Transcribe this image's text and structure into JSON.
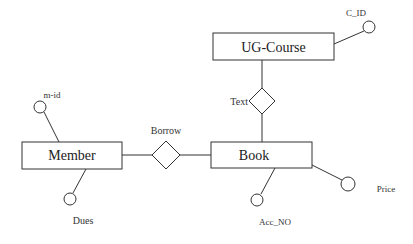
{
  "diagram": {
    "type": "ER diagram",
    "entities": [
      {
        "id": "ug_course",
        "label": "UG-Course"
      },
      {
        "id": "book",
        "label": "Book"
      },
      {
        "id": "member",
        "label": "Member"
      }
    ],
    "relationships": [
      {
        "id": "text",
        "label": "Text",
        "connects": [
          "UG-Course",
          "Book"
        ]
      },
      {
        "id": "borrow",
        "label": "Borrow",
        "connects": [
          "Member",
          "Book"
        ]
      }
    ],
    "attributes": [
      {
        "id": "c_id",
        "label": "C_ID",
        "entity": "UG-Course"
      },
      {
        "id": "m_id",
        "label": "m-id",
        "entity": "Member"
      },
      {
        "id": "dues",
        "label": "Dues",
        "entity": "Member"
      },
      {
        "id": "acc_no",
        "label": "Acc_NO",
        "entity": "Book"
      },
      {
        "id": "price",
        "label": "Price",
        "entity": "Book"
      }
    ]
  },
  "labels": {
    "ug_course": "UG-Course",
    "book": "Book",
    "member": "Member",
    "text": "Text",
    "borrow": "Borrow",
    "c_id": "C_ID",
    "m_id": "m-id",
    "dues": "Dues",
    "acc_no": "Acc_NO",
    "price": "Price"
  },
  "colors": {
    "stroke": "#333333",
    "background": "#ffffff"
  }
}
